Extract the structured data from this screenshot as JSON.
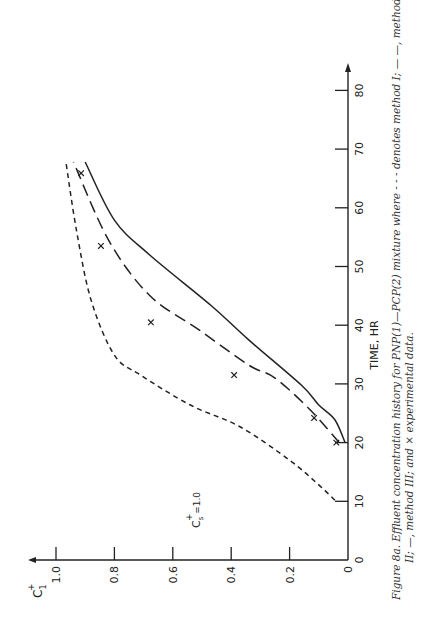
{
  "chart_data": {
    "type": "line",
    "orientation": "rotated-90-ccw",
    "title": "",
    "xlabel": "TIME, HR",
    "ylabel": "C1+",
    "xlim": [
      0,
      80
    ],
    "ylim": [
      0,
      1.0
    ],
    "x_ticks": [
      0,
      10,
      20,
      30,
      40,
      50,
      60,
      70,
      80
    ],
    "y_ticks": [
      0,
      0.2,
      0.4,
      0.6,
      0.8,
      1.0
    ],
    "y_tick_labels": [
      "0",
      "0.2",
      "0.4",
      "0.6",
      "0.8",
      "1.0"
    ],
    "grid": false,
    "annotation": "Cs+ = 1.0",
    "series": [
      {
        "name": "method I",
        "style": "short-dash",
        "x": [
          10.2,
          12.8,
          17.0,
          22.7,
          26.4,
          31.5,
          34.9,
          44.3,
          56.2,
          67.8
        ],
        "y": [
          0.045,
          0.1,
          0.2,
          0.37,
          0.54,
          0.71,
          0.8,
          0.88,
          0.93,
          0.966
        ]
      },
      {
        "name": "method II",
        "style": "long-dash",
        "x": [
          20.0,
          25.6,
          31.0,
          33.2,
          39.2,
          45.1,
          54.5,
          67.8
        ],
        "y": [
          0.03,
          0.13,
          0.25,
          0.34,
          0.51,
          0.68,
          0.82,
          0.94
        ]
      },
      {
        "name": "method III",
        "style": "solid",
        "x": [
          20.0,
          23.9,
          26.4,
          29.8,
          37.5,
          43.4,
          52.0,
          57.9,
          67.8
        ],
        "y": [
          0.01,
          0.045,
          0.1,
          0.16,
          0.34,
          0.47,
          0.68,
          0.8,
          0.9
        ]
      },
      {
        "name": "experimental data",
        "style": "x-markers",
        "x": [
          20.0,
          24.2,
          31.5,
          40.5,
          53.5,
          65.9
        ],
        "y": [
          0.04,
          0.116,
          0.39,
          0.675,
          0.846,
          0.914
        ]
      }
    ]
  },
  "labels": {
    "y_axis_label_main": "C",
    "y_axis_label_sup": "+",
    "y_axis_label_sub": "1",
    "x_axis_label": "TIME, HR",
    "annotation_main": "C",
    "annotation_sup": "+",
    "annotation_sub": "s",
    "annotation_value": " =1.0"
  },
  "caption": {
    "line1": "Figure 8a.  Effluent concentration history for PNP(1)—PCP(2) mixture where - - - denotes method I; — —, method",
    "line2": "II; —, method III; and × experimental data."
  }
}
